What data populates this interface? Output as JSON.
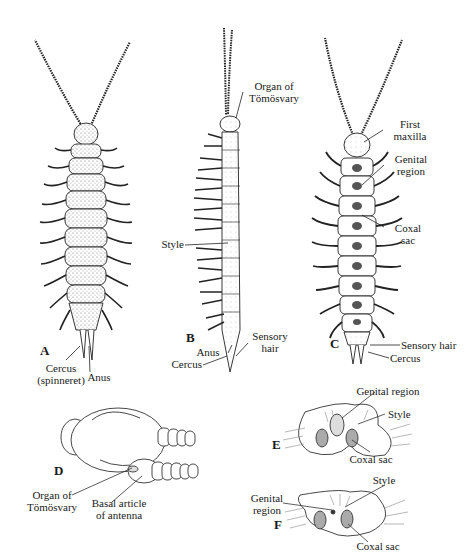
{
  "figure": {
    "panels": [
      {
        "id": "A",
        "letter": "A",
        "view": "dorsal whole animal",
        "labels": [
          {
            "key": "cercus",
            "line1": "Cercus",
            "line2": "(spinneret)"
          },
          {
            "key": "anus",
            "line1": "Anus"
          }
        ]
      },
      {
        "id": "B",
        "letter": "B",
        "view": "lateral whole animal",
        "labels": [
          {
            "key": "organ",
            "line1": "Organ of",
            "line2": "Tömösvary"
          },
          {
            "key": "style",
            "line1": "Style"
          },
          {
            "key": "sensory",
            "line1": "Sensory",
            "line2": "hair"
          },
          {
            "key": "anus",
            "line1": "Anus"
          },
          {
            "key": "cercus",
            "line1": "Cercus"
          }
        ]
      },
      {
        "id": "C",
        "letter": "C",
        "view": "ventral whole animal",
        "labels": [
          {
            "key": "maxilla",
            "line1": "First",
            "line2": "maxilla"
          },
          {
            "key": "genital",
            "line1": "Genital",
            "line2": "region"
          },
          {
            "key": "coxal",
            "line1": "Coxal",
            "line2": "sac"
          },
          {
            "key": "sensory",
            "line1": "Sensory hair"
          },
          {
            "key": "cercus",
            "line1": "Cercus"
          }
        ]
      },
      {
        "id": "D",
        "letter": "D",
        "view": "head detail",
        "labels": [
          {
            "key": "organ",
            "line1": "Organ of",
            "line2": "Tömösvary"
          },
          {
            "key": "basal",
            "line1": "Basal article",
            "line2": "of antenna"
          }
        ]
      },
      {
        "id": "E",
        "letter": "E",
        "view": "ventral segment detail",
        "labels": [
          {
            "key": "genital",
            "line1": "Genital region"
          },
          {
            "key": "style",
            "line1": "Style"
          },
          {
            "key": "coxal",
            "line1": "Coxal sac"
          }
        ]
      },
      {
        "id": "F",
        "letter": "F",
        "view": "ventral segment detail",
        "labels": [
          {
            "key": "genital",
            "line1": "Genital",
            "line2": "region"
          },
          {
            "key": "style",
            "line1": "Style"
          },
          {
            "key": "coxal",
            "line1": "Coxal sac"
          }
        ]
      }
    ],
    "colors": {
      "ink": "#1a1a1a",
      "stipple": "#bdbdbd",
      "paper": "#ffffff"
    }
  }
}
